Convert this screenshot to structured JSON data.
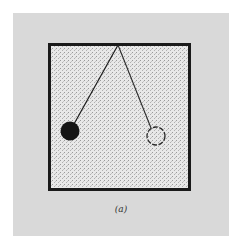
{
  "figure": {
    "caption": "(a)",
    "colors": {
      "background": "#ffffff",
      "panel": "#d9d9d9",
      "box_fill": "#e6e6e6",
      "ink": "#1a1a1a"
    },
    "elements": {
      "box": "square frame",
      "pivot": "pivot point at top of frame",
      "string_left": "pendulum string to filled bob",
      "bob_left": "filled pendulum bob (current position)",
      "string_right": "pendulum string to outlined bob",
      "bob_right": "dashed outline pendulum bob (other position)"
    }
  }
}
